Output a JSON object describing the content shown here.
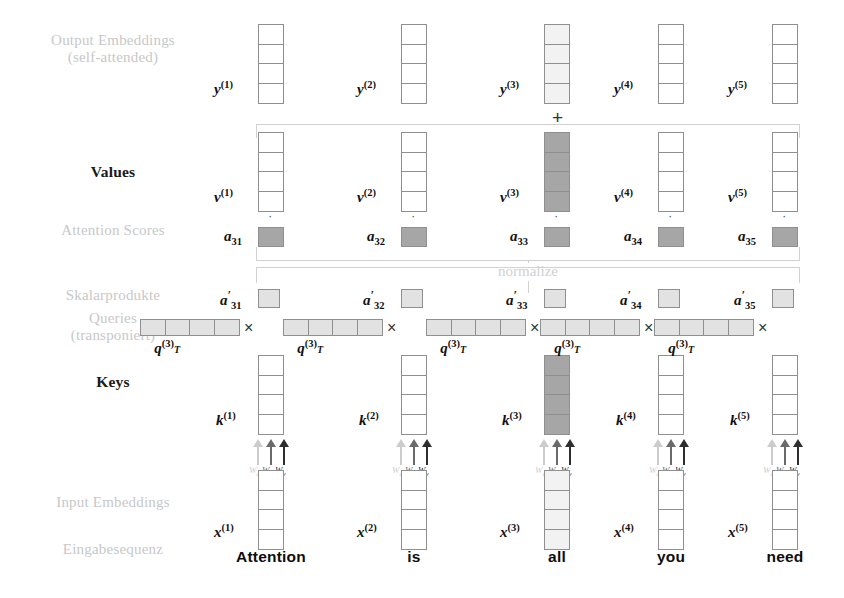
{
  "diagram": {
    "row_labels": [
      {
        "id": "output-embeddings",
        "line1": "Output Embeddings",
        "line2": "(self-attended)",
        "style": "light"
      },
      {
        "id": "values",
        "line1": "Values",
        "line2": "",
        "style": "bold"
      },
      {
        "id": "attention-scores",
        "line1": "Attention Scores",
        "line2": "",
        "style": "light"
      },
      {
        "id": "skalarprodukte",
        "line1": "Skalarprodukte",
        "line2": "",
        "style": "light"
      },
      {
        "id": "queries",
        "line1": "Queries",
        "line2": "(transponiert)",
        "style": "light"
      },
      {
        "id": "keys",
        "line1": "Keys",
        "line2": "",
        "style": "bold"
      },
      {
        "id": "input-embeddings",
        "line1": "Input Embeddings",
        "line2": "",
        "style": "light"
      },
      {
        "id": "eingabesequenz",
        "line1": "Eingabesequenz",
        "line2": "",
        "style": "light"
      }
    ],
    "normalize_label": "normalize",
    "plus_operator": "+",
    "dot_operator": "·",
    "times_operator": "×",
    "weight_labels": {
      "wq": "W",
      "wq_sub": "q",
      "wk": "W",
      "wk_sub": "k",
      "wv": "W",
      "wv_sub": "v"
    },
    "query_index": "3",
    "colors": {
      "cell_border": "#8f8f8f",
      "cell_empty": "#ffffff",
      "cell_light": "#e2e2e2",
      "cell_lite": "#f2f2f2",
      "cell_dark": "#a6a6a6",
      "label_gray": "#cfcfcf",
      "label_black": "#1a1a1a",
      "bracket": "#d2d2d2",
      "arrow_wq": "#cccccc",
      "arrow_wk": "#6a6a6a",
      "arrow_wv": "#2e2e2e"
    },
    "columns": [
      {
        "index": 1,
        "token": "Attention",
        "y_label": "y",
        "y_sup": "(1)",
        "y_fill": "empty",
        "v_label": "v",
        "v_sup": "(1)",
        "v_fill": "empty",
        "a_label": "a",
        "a_sub": "31",
        "a_fill": "dark",
        "an_label": "a",
        "an_prime": "′",
        "an_sub": "31",
        "an_fill": "light",
        "q_label": "q",
        "q_sup": "(3)",
        "q_t": "T",
        "q_fill": "light",
        "k_label": "k",
        "k_sup": "(1)",
        "k_fill": "empty",
        "x_label": "x",
        "x_sup": "(1)",
        "x_fill": "empty"
      },
      {
        "index": 2,
        "token": "is",
        "y_label": "y",
        "y_sup": "(2)",
        "y_fill": "empty",
        "v_label": "v",
        "v_sup": "(2)",
        "v_fill": "empty",
        "a_label": "a",
        "a_sub": "32",
        "a_fill": "dark",
        "an_label": "a",
        "an_prime": "′",
        "an_sub": "32",
        "an_fill": "light",
        "q_label": "q",
        "q_sup": "(3)",
        "q_t": "T",
        "q_fill": "light",
        "k_label": "k",
        "k_sup": "(2)",
        "k_fill": "empty",
        "x_label": "x",
        "x_sup": "(2)",
        "x_fill": "empty"
      },
      {
        "index": 3,
        "token": "all",
        "y_label": "y",
        "y_sup": "(3)",
        "y_fill": "lite",
        "v_label": "v",
        "v_sup": "(3)",
        "v_fill": "dark",
        "a_label": "a",
        "a_sub": "33",
        "a_fill": "dark",
        "an_label": "a",
        "an_prime": "′",
        "an_sub": "33",
        "an_fill": "light",
        "q_label": "q",
        "q_sup": "(3)",
        "q_t": "T",
        "q_fill": "light",
        "k_label": "k",
        "k_sup": "(3)",
        "k_fill": "dark",
        "x_label": "x",
        "x_sup": "(3)",
        "x_fill": "lite"
      },
      {
        "index": 4,
        "token": "you",
        "y_label": "y",
        "y_sup": "(4)",
        "y_fill": "empty",
        "v_label": "v",
        "v_sup": "(4)",
        "v_fill": "empty",
        "a_label": "a",
        "a_sub": "34",
        "a_fill": "dark",
        "an_label": "a",
        "an_prime": "′",
        "an_sub": "34",
        "an_fill": "light",
        "q_label": "q",
        "q_sup": "(3)",
        "q_t": "T",
        "q_fill": "light",
        "k_label": "k",
        "k_sup": "(4)",
        "k_fill": "empty",
        "x_label": "x",
        "x_sup": "(4)",
        "x_fill": "empty"
      },
      {
        "index": 5,
        "token": "need",
        "y_label": "y",
        "y_sup": "(5)",
        "y_fill": "empty",
        "v_label": "v",
        "v_sup": "(5)",
        "v_fill": "empty",
        "a_label": "a",
        "a_sub": "35",
        "a_fill": "dark",
        "an_label": "a",
        "an_prime": "′",
        "an_sub": "35",
        "an_fill": "light",
        "q_label": "q",
        "q_sup": "(3)",
        "q_t": "T",
        "q_fill": "light",
        "k_label": "k",
        "k_sup": "(5)",
        "k_fill": "empty",
        "x_label": "x",
        "x_sup": "(5)",
        "x_fill": "empty"
      }
    ]
  }
}
